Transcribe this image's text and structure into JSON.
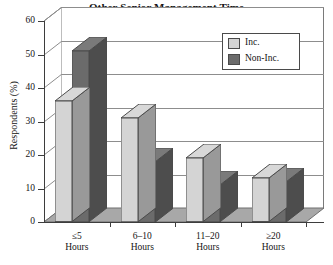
{
  "chart_data": {
    "type": "bar",
    "title": "Other Senior Management Time",
    "xlabel": "",
    "ylabel": "Respondents (%)",
    "categories": [
      "≤5\nHours",
      "6–10\nHours",
      "11–20\nHours",
      "≥20\nHours"
    ],
    "category_lines": [
      [
        "≤5",
        "Hours"
      ],
      [
        "6–10",
        "Hours"
      ],
      [
        "11–20",
        "Hours"
      ],
      [
        "≥20",
        "Hours"
      ]
    ],
    "series": [
      {
        "name": "Inc.",
        "color": "#d4d4d4",
        "values": [
          36,
          31,
          19,
          13
        ]
      },
      {
        "name": "Non-Inc.",
        "color": "#6b6b6b",
        "values": [
          51,
          18,
          11,
          12
        ]
      }
    ],
    "ylim": [
      0,
      60
    ],
    "yticks": [
      0,
      10,
      20,
      30,
      40,
      50,
      60
    ],
    "ytick_labels": [
      "0",
      "10",
      "20",
      "30",
      "40",
      "50",
      "60"
    ],
    "grid": true,
    "legend_position": "top-right",
    "projection": "3d"
  },
  "legend": {
    "items": [
      {
        "label": "Inc.",
        "color": "#d4d4d4"
      },
      {
        "label": "Non-Inc.",
        "color": "#6b6b6b"
      }
    ]
  },
  "colors": {
    "series_inc": "#d4d4d4",
    "series_non_inc": "#6b6b6b",
    "floor": "#a8a8a8",
    "wall": "#ffffff",
    "axis": "#3d3d3d",
    "grid": "#8d8d8d",
    "text": "#141414"
  }
}
